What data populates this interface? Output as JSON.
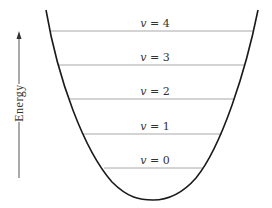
{
  "diagram": {
    "type": "potential-energy-well",
    "axis": {
      "label": "Energy",
      "direction": "up"
    },
    "levels": [
      {
        "var": "v",
        "eq": " = ",
        "n": "4",
        "y": 31,
        "x1": 51,
        "x2": 254
      },
      {
        "var": "v",
        "eq": " = ",
        "n": "3",
        "y": 65,
        "x1": 58,
        "x2": 245
      },
      {
        "var": "v",
        "eq": " = ",
        "n": "2",
        "y": 99,
        "x1": 70,
        "x2": 234
      },
      {
        "var": "v",
        "eq": " = ",
        "n": "1",
        "y": 134,
        "x1": 83,
        "x2": 222
      },
      {
        "var": "v",
        "eq": " = ",
        "n": "0",
        "y": 168,
        "x1": 104,
        "x2": 202
      }
    ],
    "colors": {
      "curve": "#1a1a1a",
      "level_line": "#a8a8a8",
      "text": "#333333"
    }
  }
}
